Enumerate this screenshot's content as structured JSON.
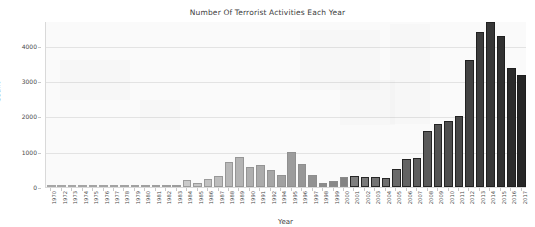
{
  "chart_data": {
    "type": "bar",
    "title": "Number Of Terrorist Activities Each Year",
    "xlabel": "Year",
    "ylabel": "Count",
    "ylim": [
      0,
      4700
    ],
    "yticks": [
      0,
      1000,
      2000,
      3000,
      4000
    ],
    "ytick_labels": [
      "0",
      "1000",
      "2000",
      "3000",
      "4000"
    ],
    "grid": true,
    "legend": "none",
    "categories": [
      "1970",
      "1972",
      "1973",
      "1974",
      "1975",
      "1976",
      "1977",
      "1978",
      "1979",
      "1980",
      "1981",
      "1982",
      "1983",
      "1984",
      "1985",
      "1986",
      "1987",
      "1988",
      "1989",
      "1990",
      "1991",
      "1992",
      "1994",
      "1995",
      "1996",
      "1997",
      "1998",
      "1999",
      "2000",
      "2001",
      "2002",
      "2003",
      "2004",
      "2005",
      "2006",
      "2007",
      "2008",
      "2009",
      "2010",
      "2011",
      "2012",
      "2013",
      "2014",
      "2015",
      "2016",
      "2017"
    ],
    "values": [
      12,
      6,
      4,
      6,
      8,
      10,
      8,
      6,
      55,
      14,
      8,
      6,
      70,
      210,
      120,
      235,
      305,
      700,
      840,
      560,
      635,
      495,
      350,
      1000,
      645,
      335,
      100,
      180,
      280,
      320,
      270,
      275,
      265,
      520,
      800,
      830,
      1600,
      1780,
      1880,
      2020,
      3590,
      4390,
      4670,
      4270,
      3380,
      3170
    ]
  },
  "axis": {
    "y_title": "Count",
    "x_title": "Year"
  }
}
